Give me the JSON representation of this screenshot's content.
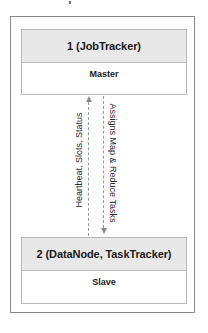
{
  "diagram": {
    "type": "master-slave architecture",
    "master_node": {
      "header": "1 (JobTracker)",
      "role": "Master"
    },
    "slave_node": {
      "header": "2 (DataNode, TaskTracker)",
      "role": "Slave"
    },
    "edges": [
      {
        "from": "slave",
        "to": "master",
        "direction": "up",
        "label": "Heartbeat, Slots, Status",
        "style": "dashed"
      },
      {
        "from": "master",
        "to": "slave",
        "direction": "down",
        "label": "Assigns Map & Reduce Tasks",
        "style": "dashed"
      }
    ],
    "colors": {
      "header_fill": "#e8e8e8",
      "border": "#b8b8b8",
      "outer_border": "#8a8a8a",
      "arrow": "#9a9a9a",
      "text": "#1a1a1a"
    }
  }
}
